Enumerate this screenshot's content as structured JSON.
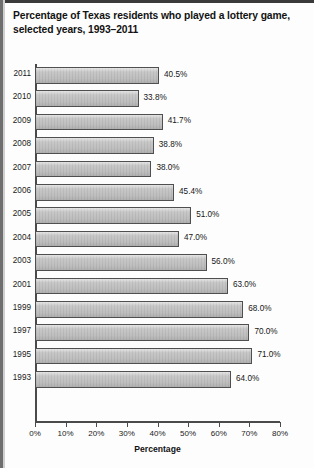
{
  "title": "Percentage of Texas residents who played a lottery game, selected years, 1993–2011",
  "chart_data": {
    "type": "bar",
    "orientation": "horizontal",
    "title": "Percentage of Texas residents who played a lottery game, selected years, 1993–2011",
    "xlabel": "Percentage",
    "ylabel": "",
    "xlim": [
      0,
      80
    ],
    "grid": false,
    "legend": null,
    "xticks": [
      "0%",
      "10%",
      "20%",
      "30%",
      "40%",
      "50%",
      "60%",
      "70%",
      "80%"
    ],
    "xtick_values": [
      0,
      10,
      20,
      30,
      40,
      50,
      60,
      70,
      80
    ],
    "categories": [
      "2011",
      "2010",
      "2009",
      "2008",
      "2007",
      "2006",
      "2005",
      "2004",
      "2003",
      "2001",
      "1999",
      "1997",
      "1995",
      "1993"
    ],
    "values": [
      40.5,
      33.8,
      41.7,
      38.8,
      38.0,
      45.4,
      51.0,
      47.0,
      56.0,
      63.0,
      68.0,
      70.0,
      71.0,
      64.0
    ],
    "data_labels": [
      "40.5%",
      "33.8%",
      "41.7%",
      "38.8%",
      "38.0%",
      "45.4%",
      "51.0%",
      "47.0%",
      "56.0%",
      "63.0%",
      "68.0%",
      "70.0%",
      "71.0%",
      "64.0%"
    ],
    "bar_color": "#c6c6c6",
    "bar_border_color": "#4f4f4f",
    "axis_color": "#4a4a4a",
    "text_color": "#121212"
  }
}
